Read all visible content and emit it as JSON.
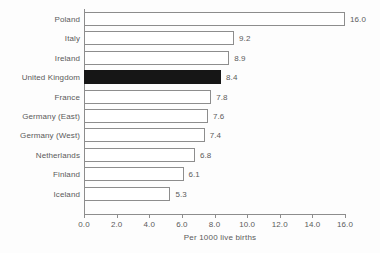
{
  "chart_data": {
    "type": "bar",
    "orientation": "horizontal",
    "title": "",
    "subtitle": "",
    "xlabel": "Per 1000 live births",
    "ylabel": "",
    "categories": [
      "Poland",
      "Italy",
      "Ireland",
      "United Kingdom",
      "France",
      "Germany (East)",
      "Germany (West)",
      "Netherlands",
      "Finland",
      "Iceland"
    ],
    "values": [
      16.0,
      9.2,
      8.9,
      8.4,
      7.8,
      7.6,
      7.4,
      6.8,
      6.1,
      5.3
    ],
    "value_labels": [
      "16.0",
      "9.2",
      "8.9",
      "8.4",
      "7.8",
      "7.6",
      "7.4",
      "6.8",
      "6.1",
      "5.3"
    ],
    "highlighted_category": "United Kingdom",
    "highlight_color": "#161616",
    "bar_fill_color": "#ffffff",
    "bar_edge_color": "#8d8d8d",
    "xlim": [
      0.0,
      16.0
    ],
    "xticks": [
      0.0,
      2.0,
      4.0,
      6.0,
      8.0,
      10.0,
      12.0,
      14.0,
      16.0
    ],
    "xtick_labels": [
      "0.0",
      "2.0",
      "4.0",
      "6.0",
      "8.0",
      "10.0",
      "12.0",
      "14.0",
      "16.0"
    ],
    "grid": false,
    "legend": null,
    "background_color": "#fdfdfd",
    "text_color": "#5a5a5a"
  }
}
